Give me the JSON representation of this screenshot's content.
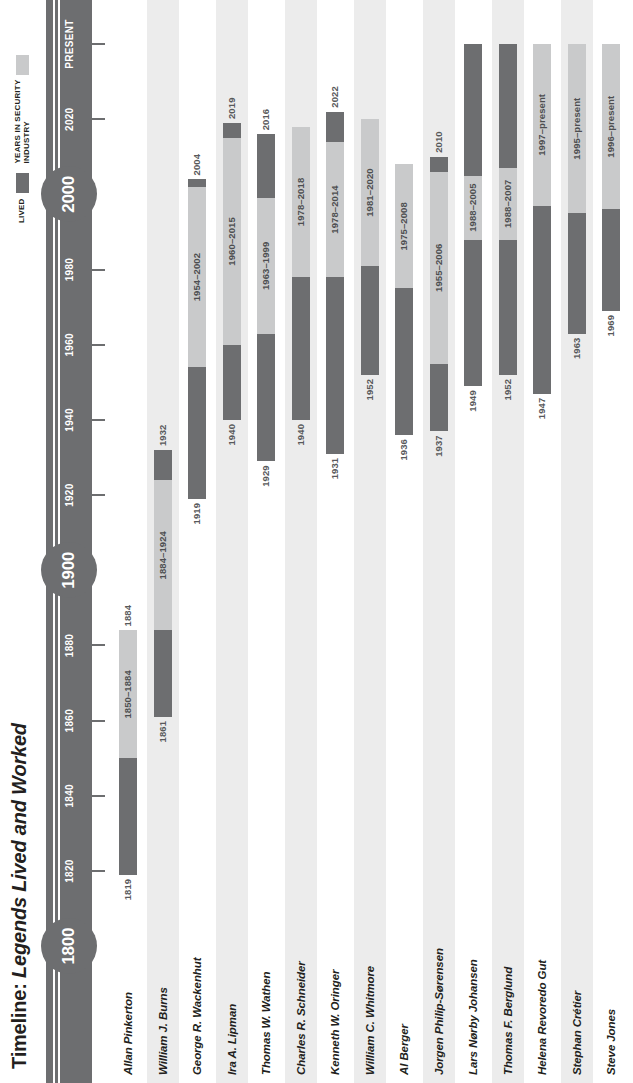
{
  "title": {
    "prefix": "Timeline:",
    "emphasis": "Legends Lived and Worked"
  },
  "legend": {
    "lived_label": "LIVED",
    "worked_label": "YEARS IN SECURITY\nINDUSTRY",
    "lived_color": "#6d6e70",
    "worked_color": "#c9cacb"
  },
  "axis": {
    "nodes": [
      {
        "label": "1800",
        "year": 1800
      },
      {
        "label": "1900",
        "year": 1900
      },
      {
        "label": "2000",
        "year": 2000
      }
    ],
    "ticks": [
      {
        "label": "1820",
        "year": 1820
      },
      {
        "label": "1840",
        "year": 1840
      },
      {
        "label": "1860",
        "year": 1860
      },
      {
        "label": "1880",
        "year": 1880
      },
      {
        "label": "1920",
        "year": 1920
      },
      {
        "label": "1940",
        "year": 1940
      },
      {
        "label": "1960",
        "year": 1960
      },
      {
        "label": "1980",
        "year": 1980
      },
      {
        "label": "2020",
        "year": 2020
      },
      {
        "label": "PRESENT",
        "year": 2040
      }
    ],
    "range": [
      1795,
      2048
    ]
  },
  "chart_data": {
    "type": "bar",
    "title": "Timeline: Legends Lived and Worked",
    "xlabel": "",
    "ylabel": "",
    "xlim": [
      1795,
      2048
    ],
    "grid": false,
    "legend_position": "top-right",
    "series": [
      {
        "name": "LIVED",
        "color": "#6d6e70"
      },
      {
        "name": "YEARS IN SECURITY INDUSTRY",
        "color": "#c9cacb"
      }
    ],
    "categories": [
      "Allan Pinkerton",
      "William J. Burns",
      "George R. Wackenhut",
      "Ira A. Lipman",
      "Thomas W. Wathen",
      "Charles R. Schneider",
      "Kenneth W. Oringer",
      "William C. Whitmore",
      "Al Berger",
      "Jorgen Philip-Sørensen",
      "Lars Nørby Johansen",
      "Thomas F. Berglund",
      "Helena Revoredo Gut",
      "Stephan Crétier",
      "Steve Jones"
    ],
    "rows": [
      {
        "name": "Allan Pinkerton",
        "start_label": "1819",
        "work_label": "1850–1884",
        "end_label": "1884",
        "lived_from": 1819,
        "lived_to": 1850,
        "worked_from": 1850,
        "worked_to": 1884,
        "tail_from": null,
        "tail_to": null
      },
      {
        "name": "William J. Burns",
        "start_label": "1861",
        "work_label": "1884–1924",
        "end_label": "1932",
        "lived_from": 1861,
        "lived_to": 1884,
        "worked_from": 1884,
        "worked_to": 1924,
        "tail_from": 1924,
        "tail_to": 1932
      },
      {
        "name": "George R. Wackenhut",
        "start_label": "1919",
        "work_label": "1954–2002",
        "end_label": "2004",
        "lived_from": 1919,
        "lived_to": 1954,
        "worked_from": 1954,
        "worked_to": 2002,
        "tail_from": 2002,
        "tail_to": 2004
      },
      {
        "name": "Ira A. Lipman",
        "start_label": "1940",
        "work_label": "1960–2015",
        "end_label": "2019",
        "lived_from": 1940,
        "lived_to": 1960,
        "worked_from": 1960,
        "worked_to": 2015,
        "tail_from": 2015,
        "tail_to": 2019
      },
      {
        "name": "Thomas W. Wathen",
        "start_label": "1929",
        "work_label": "1963–1999",
        "end_label": "2016",
        "lived_from": 1929,
        "lived_to": 1963,
        "worked_from": 1963,
        "worked_to": 1999,
        "tail_from": 1999,
        "tail_to": 2016
      },
      {
        "name": "Charles R. Schneider",
        "start_label": "1940",
        "work_label": "1978–2018",
        "end_label": "",
        "lived_from": 1940,
        "lived_to": 1978,
        "worked_from": 1978,
        "worked_to": 2018,
        "tail_from": null,
        "tail_to": null
      },
      {
        "name": "Kenneth W. Oringer",
        "start_label": "1931",
        "work_label": "1978–2014",
        "end_label": "2022",
        "lived_from": 1931,
        "lived_to": 1978,
        "worked_from": 1978,
        "worked_to": 2014,
        "tail_from": 2014,
        "tail_to": 2022
      },
      {
        "name": "William C. Whitmore",
        "start_label": "1952",
        "work_label": "1981–2020",
        "end_label": "",
        "lived_from": 1952,
        "lived_to": 1981,
        "worked_from": 1981,
        "worked_to": 2020,
        "tail_from": null,
        "tail_to": null
      },
      {
        "name": "Al Berger",
        "start_label": "1936",
        "work_label": "1975–2008",
        "end_label": "",
        "lived_from": 1936,
        "lived_to": 1975,
        "worked_from": 1975,
        "worked_to": 2008,
        "tail_from": null,
        "tail_to": null
      },
      {
        "name": "Jorgen Philip-Sørensen",
        "start_label": "1937",
        "work_label": "1955–2006",
        "end_label": "2010",
        "lived_from": 1937,
        "lived_to": 1955,
        "worked_from": 1955,
        "worked_to": 2006,
        "tail_from": 2006,
        "tail_to": 2010
      },
      {
        "name": "Lars Nørby Johansen",
        "start_label": "1949",
        "work_label": "1988–2005",
        "end_label": "",
        "lived_from": 1949,
        "lived_to": 1988,
        "worked_from": 1988,
        "worked_to": 2005,
        "tail_from": 2005,
        "tail_to": 2040
      },
      {
        "name": "Thomas F. Berglund",
        "start_label": "1952",
        "work_label": "1988–2007",
        "end_label": "",
        "lived_from": 1952,
        "lived_to": 1988,
        "worked_from": 1988,
        "worked_to": 2007,
        "tail_from": 2007,
        "tail_to": 2040
      },
      {
        "name": "Helena Revoredo Gut",
        "start_label": "1947",
        "work_label": "1997–present",
        "end_label": "",
        "lived_from": 1947,
        "lived_to": 1997,
        "worked_from": 1997,
        "worked_to": 2040,
        "tail_from": null,
        "tail_to": null
      },
      {
        "name": "Stephan Crétier",
        "start_label": "1963",
        "work_label": "1995–present",
        "end_label": "",
        "lived_from": 1963,
        "lived_to": 1995,
        "worked_from": 1995,
        "worked_to": 2040,
        "tail_from": null,
        "tail_to": null
      },
      {
        "name": "Steve Jones",
        "start_label": "1969",
        "work_label": "1996–present",
        "end_label": "",
        "lived_from": 1969,
        "lived_to": 1996,
        "worked_from": 1996,
        "worked_to": 2040,
        "tail_from": null,
        "tail_to": null
      }
    ]
  }
}
